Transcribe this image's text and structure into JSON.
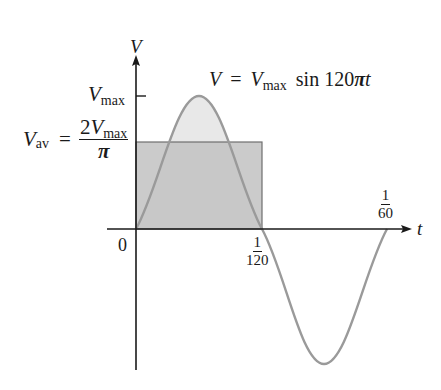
{
  "diagram": {
    "axes": {
      "y_label": "V",
      "x_label": "t",
      "origin_label": "0"
    },
    "equation": {
      "lhs": "V",
      "equals": "=",
      "vmax_base": "V",
      "vmax_sub": "max",
      "func": "sin 120",
      "pi": "π",
      "var": "t"
    },
    "vmax_label": {
      "base": "V",
      "sub": "max"
    },
    "vav_label": {
      "base": "V",
      "sub": "av",
      "equals": "=",
      "numerator_coef": "2",
      "numerator_base": "V",
      "numerator_sub": "max",
      "denominator": "π"
    },
    "x_ticks": [
      {
        "num": "1",
        "den": "120"
      },
      {
        "num": "1",
        "den": "60"
      }
    ],
    "colors": {
      "axis": "#1a1a1a",
      "curve": "#9a9a9a",
      "sine_fill": "#e6e6e6",
      "rect_fill": "#bdbdbd",
      "rect_stroke": "#6f6f6f"
    }
  }
}
